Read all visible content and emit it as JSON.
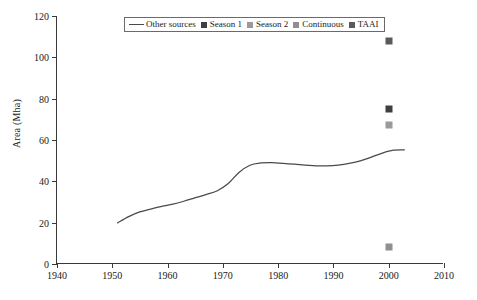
{
  "chart_data": {
    "type": "line",
    "title": "",
    "xlabel": "",
    "ylabel": "Area (Mha)",
    "xlim": [
      1940,
      2010
    ],
    "ylim": [
      0,
      120
    ],
    "xticks": [
      1940,
      1950,
      1960,
      1970,
      1980,
      1990,
      2000,
      2010
    ],
    "yticks": [
      0,
      20,
      40,
      60,
      80,
      100,
      120
    ],
    "grid": false,
    "legend_position": "top-center-inside",
    "series": [
      {
        "name": "Other sources",
        "type": "line",
        "color": "#4a4a4a",
        "x": [
          1951,
          1953,
          1955,
          1957,
          1959,
          1961,
          1963,
          1965,
          1967,
          1969,
          1971,
          1973,
          1975,
          1977,
          1979,
          1981,
          1983,
          1985,
          1987,
          1989,
          1991,
          1993,
          1995,
          1997,
          1999,
          2001,
          2003
        ],
        "values": [
          19.5,
          22.5,
          24.8,
          26.2,
          27.5,
          28.6,
          30.0,
          31.6,
          33.2,
          35.0,
          38.5,
          44.0,
          47.5,
          48.6,
          48.8,
          48.4,
          48.0,
          47.6,
          47.2,
          47.2,
          47.6,
          48.4,
          49.6,
          51.4,
          53.4,
          54.8,
          55.0
        ]
      },
      {
        "name": "Season 1",
        "type": "scatter",
        "color": "#3f3f3f",
        "x": [
          2000
        ],
        "values": [
          75.0
        ]
      },
      {
        "name": "Season 2",
        "type": "scatter",
        "color": "#9a9a9a",
        "x": [
          2000
        ],
        "values": [
          67.5
        ]
      },
      {
        "name": "Continuous",
        "type": "scatter",
        "color": "#8f8f8f",
        "x": [
          2000
        ],
        "values": [
          8.0
        ]
      },
      {
        "name": "TAAI",
        "type": "scatter",
        "color": "#5a5a5a",
        "x": [
          2000
        ],
        "values": [
          108.0
        ]
      }
    ]
  },
  "axes": {
    "ylabel": "Area (Mha)",
    "ytick_labels": [
      "0",
      "20",
      "40",
      "60",
      "80",
      "100",
      "120"
    ],
    "xtick_labels": [
      "1940",
      "1950",
      "1960",
      "1970",
      "1980",
      "1990",
      "2000",
      "2010"
    ]
  },
  "legend": {
    "entries": [
      {
        "label": "Other sources",
        "marker": "line",
        "color": "#4a4a4a"
      },
      {
        "label": "Season 1",
        "marker": "square",
        "color": "#3f3f3f"
      },
      {
        "label": "Season 2",
        "marker": "square",
        "color": "#9a9a9a"
      },
      {
        "label": "Continuous",
        "marker": "square",
        "color": "#8f8f8f"
      },
      {
        "label": "TAAI",
        "marker": "square",
        "color": "#5a5a5a"
      }
    ]
  },
  "colors": {
    "axis": "#3a3a3a",
    "background": "#ffffff",
    "text": "#1a1a1a"
  }
}
